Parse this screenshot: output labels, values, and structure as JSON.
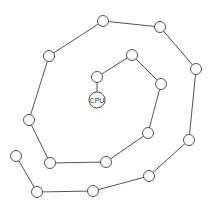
{
  "diagram": {
    "type": "spiral-chain",
    "center_node": {
      "label": "CPU",
      "x": 97,
      "y": 100,
      "r": 8
    },
    "node_radius": 5.5,
    "nodes": [
      {
        "x": 97,
        "y": 77
      },
      {
        "x": 132,
        "y": 55
      },
      {
        "x": 161,
        "y": 84
      },
      {
        "x": 148,
        "y": 133
      },
      {
        "x": 106,
        "y": 162
      },
      {
        "x": 50,
        "y": 163
      },
      {
        "x": 29,
        "y": 120
      },
      {
        "x": 49,
        "y": 56
      },
      {
        "x": 103,
        "y": 21
      },
      {
        "x": 160,
        "y": 27
      },
      {
        "x": 196,
        "y": 69
      },
      {
        "x": 189,
        "y": 140
      },
      {
        "x": 149,
        "y": 176
      },
      {
        "x": 93,
        "y": 191
      },
      {
        "x": 37,
        "y": 192
      },
      {
        "x": 16,
        "y": 156
      }
    ],
    "colors": {
      "stroke": "#555555",
      "fill": "#ffffff",
      "background": "#ffffff"
    }
  }
}
